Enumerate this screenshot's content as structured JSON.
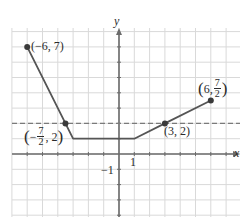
{
  "chart_data": {
    "type": "line",
    "title": "",
    "xlabel": "x",
    "ylabel": "y",
    "xlim": [
      -7,
      8
    ],
    "ylim": [
      -4,
      8
    ],
    "grid": true,
    "grid_step": 1,
    "tick_labels": {
      "x": [
        "1"
      ],
      "y": [
        "-1"
      ]
    },
    "series": [
      {
        "name": "piecewise graph",
        "x": [
          -6,
          -3.5,
          -3,
          1,
          3,
          6
        ],
        "y": [
          7,
          2,
          1,
          1,
          2,
          3.5
        ],
        "color": "#555555"
      },
      {
        "name": "horizontal line y = 2",
        "style": "dashed",
        "y": 2,
        "color": "#777777"
      }
    ],
    "labeled_points": [
      {
        "x": -6,
        "y": 7,
        "label": "(−6, 7)"
      },
      {
        "x": -3.5,
        "y": 2,
        "label": "(−7/2, 2)"
      },
      {
        "x": 3,
        "y": 2,
        "label": "(3, 2)"
      },
      {
        "x": 6,
        "y": 3.5,
        "label": "(6, 7/2)"
      }
    ]
  },
  "labels": {
    "x_axis": "x",
    "y_axis": "y",
    "tick_x_1": "1",
    "tick_y_neg1": "−1",
    "p1": "(−6, 7)",
    "p2_open": "(",
    "p2_minus": "−",
    "p2_num": "7",
    "p2_den": "2",
    "p2_rest": ", 2",
    "p2_close": ")",
    "p3": "(3, 2)",
    "p4_open": "(",
    "p4_pre": "6,",
    "p4_num": "7",
    "p4_den": "2",
    "p4_close": ")"
  },
  "colors": {
    "grid": "#d9d9d9",
    "axis": "#6b6b6b",
    "curve": "#555555",
    "dashed": "#7a7a7a",
    "point": "#3a3a3a"
  }
}
